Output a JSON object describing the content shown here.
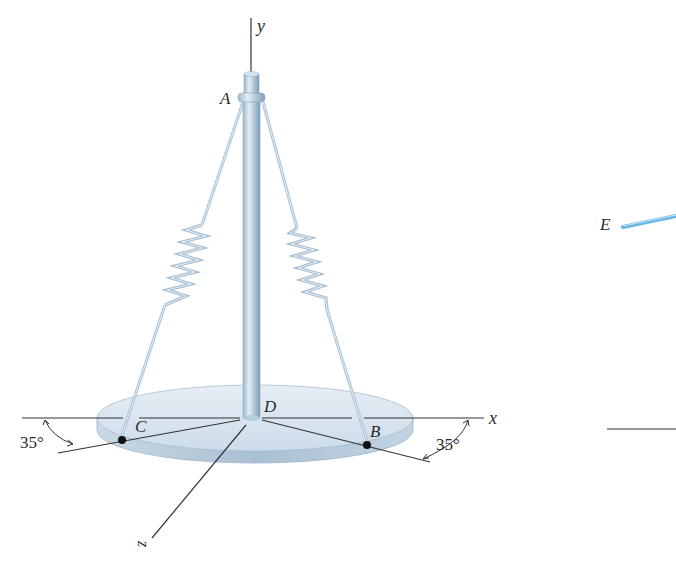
{
  "figure": {
    "labels": {
      "y_axis": "y",
      "x_axis": "x",
      "z_axis": "z",
      "point_a": "A",
      "point_b": "B",
      "point_c": "C",
      "point_d": "D",
      "point_e": "E"
    },
    "angles": {
      "left_angle": "35°",
      "right_angle": "35°"
    },
    "colors": {
      "steel": "#b8cfe0",
      "steel_dark": "#7f9fb8",
      "disc_top": "#dce8f2",
      "disc_edge": "#b4c9da",
      "rod_e": "#6bb6e6",
      "line": "#333333"
    }
  }
}
